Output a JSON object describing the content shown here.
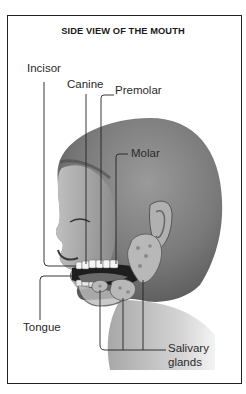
{
  "diagram": {
    "title": "SIDE VIEW OF THE MOUTH",
    "labels": {
      "incisor": "Incisor",
      "canine": "Canine",
      "premolar": "Premolar",
      "molar": "Molar",
      "tongue": "Tongue",
      "salivary_line1": "Salivary",
      "salivary_line2": "glands"
    },
    "colors": {
      "frame": "#222222",
      "text": "#2a2a2a",
      "skin_dark": "#5a5a5a",
      "skin_light": "#d8d8d8",
      "teeth": "#f4f4f4",
      "gland": "#b8b8b8"
    }
  }
}
